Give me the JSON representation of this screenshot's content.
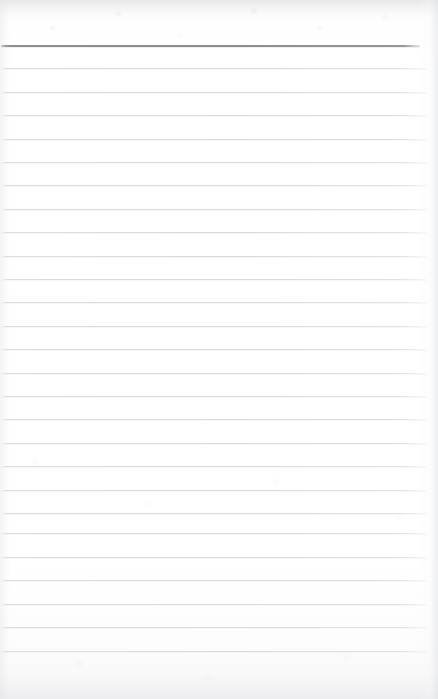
{
  "document": {
    "type": "lined-notepad-page",
    "title": "Blank ruled notepad page",
    "content_text": "",
    "page_width": 438,
    "page_height": 699
  },
  "colors": {
    "paper": "#fefefe",
    "paper_edge": "#f2f2f3",
    "rule_line": "#dcdde0",
    "header_rule_line": "#8d8f94"
  },
  "ruling": {
    "header_rule": {
      "label": "header-rule",
      "y": 45,
      "x_start": 1,
      "x_end": 420,
      "thickness": 2,
      "color": "#8d8f94"
    },
    "line_spacing": 23.4,
    "line_color": "#dcdde0",
    "line_thickness": 1,
    "x_start": 2,
    "x_end": 427,
    "count": 26,
    "lines": [
      {
        "label": "rule-line-1",
        "y": 68.4,
        "x_start": 2,
        "x_end": 427
      },
      {
        "label": "rule-line-2",
        "y": 91.8,
        "x_start": 2,
        "x_end": 427
      },
      {
        "label": "rule-line-3",
        "y": 115.2,
        "x_start": 2,
        "x_end": 427
      },
      {
        "label": "rule-line-4",
        "y": 138.6,
        "x_start": 2,
        "x_end": 427
      },
      {
        "label": "rule-line-5",
        "y": 162.0,
        "x_start": 2,
        "x_end": 427
      },
      {
        "label": "rule-line-6",
        "y": 185.4,
        "x_start": 2,
        "x_end": 427
      },
      {
        "label": "rule-line-7",
        "y": 208.8,
        "x_start": 2,
        "x_end": 427
      },
      {
        "label": "rule-line-8",
        "y": 232.2,
        "x_start": 2,
        "x_end": 427
      },
      {
        "label": "rule-line-9",
        "y": 255.6,
        "x_start": 2,
        "x_end": 427
      },
      {
        "label": "rule-line-10",
        "y": 279.0,
        "x_start": 2,
        "x_end": 427
      },
      {
        "label": "rule-line-11",
        "y": 302.4,
        "x_start": 2,
        "x_end": 427
      },
      {
        "label": "rule-line-12",
        "y": 325.8,
        "x_start": 2,
        "x_end": 427
      },
      {
        "label": "rule-line-13",
        "y": 349.2,
        "x_start": 2,
        "x_end": 427
      },
      {
        "label": "rule-line-14",
        "y": 372.6,
        "x_start": 2,
        "x_end": 427
      },
      {
        "label": "rule-line-15",
        "y": 396.0,
        "x_start": 2,
        "x_end": 427
      },
      {
        "label": "rule-line-16",
        "y": 419.4,
        "x_start": 2,
        "x_end": 427
      },
      {
        "label": "rule-line-17",
        "y": 442.8,
        "x_start": 2,
        "x_end": 427
      },
      {
        "label": "rule-line-18",
        "y": 466.2,
        "x_start": 2,
        "x_end": 427
      },
      {
        "label": "rule-line-19",
        "y": 489.6,
        "x_start": 2,
        "x_end": 427
      },
      {
        "label": "rule-line-20",
        "y": 513.0,
        "x_start": 2,
        "x_end": 427
      },
      {
        "label": "rule-line-21",
        "y": 533.4,
        "x_start": 2,
        "x_end": 427
      },
      {
        "label": "rule-line-22",
        "y": 556.8,
        "x_start": 2,
        "x_end": 427
      },
      {
        "label": "rule-line-23",
        "y": 580.2,
        "x_start": 2,
        "x_end": 427
      },
      {
        "label": "rule-line-24",
        "y": 603.6,
        "x_start": 2,
        "x_end": 427
      },
      {
        "label": "rule-line-25",
        "y": 627.0,
        "x_start": 2,
        "x_end": 427
      },
      {
        "label": "rule-line-26",
        "y": 651.0,
        "x_start": 2,
        "x_end": 427
      }
    ]
  }
}
